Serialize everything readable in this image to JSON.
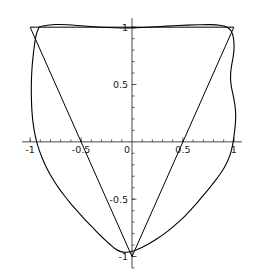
{
  "chart_data": {
    "type": "line",
    "title": "",
    "xlabel": "",
    "ylabel": "",
    "xlim": [
      -1.08,
      1.08
    ],
    "ylim": [
      -1.1,
      1.08
    ],
    "grid": false,
    "legend": null,
    "axis_style": "centered-cross",
    "xticks": [
      -1,
      -0.5,
      0,
      0.5,
      1
    ],
    "xtick_labels": [
      "-1",
      "-0.5",
      "0",
      "0.5",
      "1"
    ],
    "yticks": [
      -1,
      -0.5,
      0.5,
      1
    ],
    "ytick_labels": [
      "-1",
      "-0.5",
      "0.5",
      "1"
    ],
    "minor_tick_step": 0.1,
    "series": [
      {
        "name": "triangle",
        "kind": "polygon",
        "closed": true,
        "color": "#000000",
        "points": [
          [
            -1,
            1
          ],
          [
            1,
            1
          ],
          [
            0,
            -1
          ]
        ]
      },
      {
        "name": "fourier-approximation",
        "kind": "closed-curve",
        "closed": true,
        "color": "#000000",
        "points": [
          [
            -0.905,
            1.004
          ],
          [
            -0.83,
            1.017
          ],
          [
            -0.74,
            1.023
          ],
          [
            -0.63,
            1.021
          ],
          [
            -0.5,
            1.013
          ],
          [
            -0.37,
            1.004
          ],
          [
            -0.24,
            0.997
          ],
          [
            -0.11,
            0.993
          ],
          [
            0.02,
            0.994
          ],
          [
            0.15,
            0.999
          ],
          [
            0.28,
            1.006
          ],
          [
            0.41,
            1.013
          ],
          [
            0.54,
            1.018
          ],
          [
            0.66,
            1.021
          ],
          [
            0.77,
            1.022
          ],
          [
            0.86,
            1.017
          ],
          [
            0.93,
            1.001
          ],
          [
            0.975,
            0.965
          ],
          [
            0.995,
            0.91
          ],
          [
            1.002,
            0.845
          ],
          [
            0.999,
            0.78
          ],
          [
            0.988,
            0.715
          ],
          [
            0.976,
            0.655
          ],
          [
            0.969,
            0.6
          ],
          [
            0.968,
            0.545
          ],
          [
            0.974,
            0.49
          ],
          [
            0.986,
            0.435
          ],
          [
            1.0,
            0.375
          ],
          [
            1.012,
            0.31
          ],
          [
            1.018,
            0.24
          ],
          [
            1.016,
            0.17
          ],
          [
            1.008,
            0.1
          ],
          [
            0.998,
            0.03
          ],
          [
            0.985,
            -0.04
          ],
          [
            0.966,
            -0.105
          ],
          [
            0.94,
            -0.165
          ],
          [
            0.905,
            -0.225
          ],
          [
            0.862,
            -0.285
          ],
          [
            0.812,
            -0.345
          ],
          [
            0.758,
            -0.405
          ],
          [
            0.702,
            -0.465
          ],
          [
            0.645,
            -0.525
          ],
          [
            0.585,
            -0.585
          ],
          [
            0.522,
            -0.645
          ],
          [
            0.455,
            -0.7
          ],
          [
            0.385,
            -0.755
          ],
          [
            0.312,
            -0.805
          ],
          [
            0.238,
            -0.85
          ],
          [
            0.162,
            -0.89
          ],
          [
            0.085,
            -0.925
          ],
          [
            0.01,
            -0.952
          ],
          [
            -0.058,
            -0.963
          ],
          [
            -0.118,
            -0.955
          ],
          [
            -0.168,
            -0.93
          ],
          [
            -0.215,
            -0.895
          ],
          [
            -0.265,
            -0.855
          ],
          [
            -0.32,
            -0.808
          ],
          [
            -0.378,
            -0.755
          ],
          [
            -0.438,
            -0.7
          ],
          [
            -0.498,
            -0.642
          ],
          [
            -0.556,
            -0.585
          ],
          [
            -0.612,
            -0.527
          ],
          [
            -0.665,
            -0.468
          ],
          [
            -0.715,
            -0.408
          ],
          [
            -0.762,
            -0.345
          ],
          [
            -0.805,
            -0.282
          ],
          [
            -0.845,
            -0.215
          ],
          [
            -0.88,
            -0.145
          ],
          [
            -0.912,
            -0.07
          ],
          [
            -0.938,
            0.008
          ],
          [
            -0.958,
            0.09
          ],
          [
            -0.973,
            0.175
          ],
          [
            -0.982,
            0.265
          ],
          [
            -0.987,
            0.355
          ],
          [
            -0.989,
            0.45
          ],
          [
            -0.987,
            0.545
          ],
          [
            -0.982,
            0.64
          ],
          [
            -0.973,
            0.73
          ],
          [
            -0.962,
            0.815
          ],
          [
            -0.95,
            0.89
          ],
          [
            -0.935,
            0.95
          ],
          [
            -0.92,
            0.985
          ]
        ]
      }
    ]
  }
}
